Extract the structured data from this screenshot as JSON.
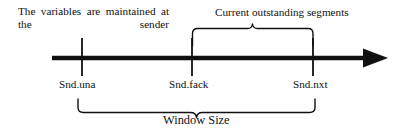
{
  "figure": {
    "background": "#ffffff",
    "ink_color": "#101010",
    "width": 401,
    "height": 135
  },
  "annotation": {
    "text": "The variables are maintained at the sender"
  },
  "braces": {
    "upper": {
      "label": "Current outstanding segments",
      "from_marker": "Snd.fack",
      "to_marker": "Snd.nxt",
      "x_start": 192,
      "x_end": 313
    },
    "lower": {
      "label": "Window Size",
      "from_marker": "Snd.una",
      "to_marker": "Snd.nxt",
      "x_start": 78,
      "x_end": 315
    }
  },
  "axis": {
    "name": "sequence-number-axis",
    "x_start": 52,
    "x_end": 388,
    "y": 58,
    "arrow_direction": "right",
    "markers": [
      {
        "id": "snd-una",
        "label": "Snd.una",
        "x": 82
      },
      {
        "id": "snd-fack",
        "label": "Snd.fack",
        "x": 192
      },
      {
        "id": "snd-nxt",
        "label": "Snd.nxt",
        "x": 313
      }
    ]
  }
}
